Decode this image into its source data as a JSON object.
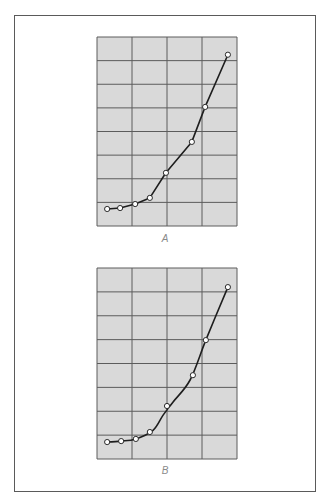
{
  "figure": {
    "panels": [
      {
        "label": "A"
      },
      {
        "label": "B"
      }
    ]
  },
  "colors": {
    "grid_fill": "#d9d9d9",
    "grid_line": "#5c5c5c",
    "curve": "#1e1e1e",
    "marker_fill": "#ffffff",
    "marker_stroke": "#2a2a2a",
    "frame": "#5a5a5a"
  },
  "chart_data": [
    {
      "type": "line",
      "title": "A",
      "xlabel": "",
      "ylabel": "",
      "grid": true,
      "grid_columns": 4,
      "grid_rows": 8,
      "xlim": [
        0,
        4
      ],
      "ylim": [
        0,
        8
      ],
      "tick_labels": "none",
      "series": [
        {
          "name": "A",
          "style": "straight segments connecting points (point-to-point)",
          "x": [
            0.29,
            0.66,
            1.09,
            1.51,
            1.97,
            2.71,
            3.09,
            3.74
          ],
          "y": [
            0.72,
            0.76,
            0.93,
            1.19,
            2.25,
            3.56,
            5.04,
            7.25
          ]
        }
      ]
    },
    {
      "type": "line",
      "title": "B",
      "xlabel": "",
      "ylabel": "",
      "grid": true,
      "grid_columns": 4,
      "grid_rows": 8,
      "xlim": [
        0,
        4
      ],
      "ylim": [
        0,
        8
      ],
      "tick_labels": "none",
      "series": [
        {
          "name": "B data points",
          "style": "open circle markers",
          "x": [
            0.29,
            0.69,
            1.11,
            1.51,
            2.0,
            2.74,
            3.11,
            3.74
          ],
          "y": [
            0.71,
            0.75,
            0.84,
            1.13,
            2.22,
            3.51,
            4.98,
            7.2
          ]
        },
        {
          "name": "B smooth fitted curve",
          "style": "smooth curve through/near points",
          "x": [
            0.29,
            0.69,
            1.11,
            1.6,
            1.89,
            2.17,
            2.66,
            3.11,
            3.74
          ],
          "y": [
            0.71,
            0.75,
            0.84,
            1.2,
            1.84,
            2.38,
            3.31,
            4.98,
            7.2
          ]
        }
      ]
    }
  ]
}
